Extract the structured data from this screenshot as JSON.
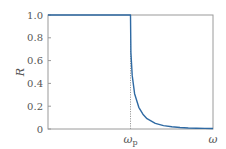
{
  "chart_data": {
    "type": "line",
    "title": "",
    "xlabel": "ω",
    "ylabel": "R",
    "ylim": [
      0,
      1.0
    ],
    "xlim": [
      0,
      2.0
    ],
    "grid": false,
    "legend": null,
    "y_ticks": [
      "0",
      "0.2",
      "0.4",
      "0.6",
      "0.8",
      "1.0"
    ],
    "y_tick_values": [
      0,
      0.2,
      0.4,
      0.6,
      0.8,
      1.0
    ],
    "x_ticks": [
      {
        "label_main": "ω",
        "label_sub": "p",
        "value": 1.0
      },
      {
        "label_main": "ω",
        "label_sub": "",
        "value": 2.0
      }
    ],
    "annotations": [
      {
        "type": "vertical-dotted-line",
        "x": 1.0,
        "label": "ω_p"
      }
    ],
    "series": [
      {
        "name": "Reflectivity R(ω)",
        "color": "#2f6aa3",
        "description": "R = 1 for ω < ω_p; R = ((1-n)/(1+n))^2 with n = sqrt(1 - ω_p²/ω²) for ω > ω_p",
        "x": [
          0,
          0.2,
          0.4,
          0.6,
          0.8,
          0.98,
          1.0,
          1.005,
          1.02,
          1.05,
          1.1,
          1.15,
          1.2,
          1.3,
          1.4,
          1.5,
          1.6,
          1.7,
          1.8,
          1.9,
          2.0
        ],
        "y": [
          1.0,
          1.0,
          1.0,
          1.0,
          1.0,
          1.0,
          1.0,
          0.67,
          0.47,
          0.31,
          0.19,
          0.13,
          0.09,
          0.05,
          0.03,
          0.02,
          0.013,
          0.009,
          0.007,
          0.005,
          0.004
        ]
      }
    ]
  },
  "colors": {
    "curve": "#2f6aa3",
    "axis": "#9a9a9a",
    "text": "#555555",
    "dotted": "#9a9a9a"
  }
}
